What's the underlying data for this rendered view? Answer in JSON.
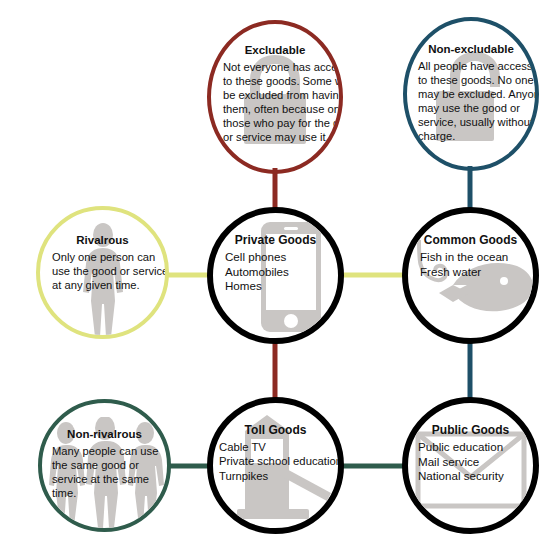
{
  "diagram": {
    "background": "#ffffff",
    "attributes": [
      {
        "id": "excludable",
        "label": "Excludable",
        "lines": [
          "Not everyone has access",
          "to these goods. Some will",
          "be excluded from having",
          "them, often because only",
          "those who pay for the good",
          "or service may use it."
        ],
        "color": "#8c2a22",
        "icon": "padlock-closed-icon"
      },
      {
        "id": "non-excludable",
        "label": "Non-excludable",
        "lines": [
          "All people have access",
          "to these goods. No one",
          "may be excluded. Anyone",
          "may use the good or",
          "service, usually without",
          "charge."
        ],
        "color": "#1e5068",
        "icon": "padlock-open-icon"
      },
      {
        "id": "rivalrous",
        "label": "Rivalrous",
        "lines": [
          "Only one person can",
          "use the good or service",
          "at any given time."
        ],
        "color": "#dfe37e",
        "icon": "single-person-icon"
      },
      {
        "id": "non-rivalrous",
        "label": "Non-rivalrous",
        "lines": [
          "Many people can use",
          "the same good or",
          "service at the same",
          "time."
        ],
        "color": "#2f5c4c",
        "icon": "three-people-icon"
      }
    ],
    "goods": [
      {
        "id": "private-goods",
        "label": "Private Goods",
        "examples": [
          "Cell phones",
          "Automobiles",
          "Homes"
        ],
        "color": "#000000",
        "icon": "smartphone-icon"
      },
      {
        "id": "common-goods",
        "label": "Common Goods",
        "examples": [
          "Fish in the ocean",
          "Fresh water"
        ],
        "color": "#000000",
        "icon": "fish-hook-icon"
      },
      {
        "id": "toll-goods",
        "label": "Toll Goods",
        "examples": [
          "Cable TV",
          "Private school education",
          "Turnpikes"
        ],
        "color": "#000000",
        "icon": "toll-barrier-icon"
      },
      {
        "id": "public-goods",
        "label": "Public Goods",
        "examples": [
          "Public education",
          "Mail service",
          "National security"
        ],
        "color": "#000000",
        "icon": "envelope-icon"
      }
    ],
    "connectors": [
      {
        "from": "excludable",
        "to": "private-goods",
        "color": "#8c2a22"
      },
      {
        "from": "non-excludable",
        "to": "common-goods",
        "color": "#1e5068"
      },
      {
        "from": "rivalrous",
        "to": "private-goods",
        "color": "#dfe37e"
      },
      {
        "from": "private-goods",
        "to": "common-goods",
        "color": "#dfe37e"
      },
      {
        "from": "private-goods",
        "to": "toll-goods",
        "color": "#8c2a22"
      },
      {
        "from": "common-goods",
        "to": "public-goods",
        "color": "#1e5068"
      },
      {
        "from": "non-rivalrous",
        "to": "toll-goods",
        "color": "#2f5c4c"
      },
      {
        "from": "toll-goods",
        "to": "public-goods",
        "color": "#2f5c4c"
      }
    ]
  }
}
